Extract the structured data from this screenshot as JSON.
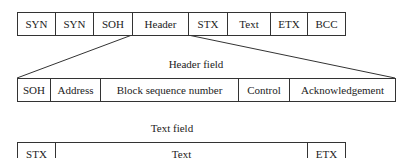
{
  "frame": {
    "fields": [
      "SYN",
      "SYN",
      "SOH",
      "Header",
      "STX",
      "Text",
      "ETX",
      "BCC"
    ]
  },
  "header_field": {
    "caption": "Header field",
    "fields": [
      "SOH",
      "Address",
      "Block sequence number",
      "Control",
      "Acknowledgement"
    ]
  },
  "text_field": {
    "caption": "Text field",
    "fields": [
      "STX",
      "Text",
      "ETX"
    ]
  }
}
